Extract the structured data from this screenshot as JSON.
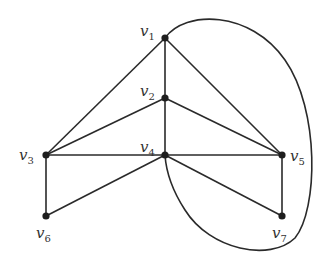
{
  "graph": {
    "nodes": [
      {
        "id": "v1",
        "label": "v",
        "sub": "1",
        "x": 165,
        "y": 38,
        "lx": 140,
        "ly": 36
      },
      {
        "id": "v2",
        "label": "v",
        "sub": "2",
        "x": 165,
        "y": 98,
        "lx": 140,
        "ly": 96
      },
      {
        "id": "v3",
        "label": "v",
        "sub": "3",
        "x": 46,
        "y": 155,
        "lx": 19,
        "ly": 160
      },
      {
        "id": "v4",
        "label": "v",
        "sub": "4",
        "x": 165,
        "y": 155,
        "lx": 140,
        "ly": 152
      },
      {
        "id": "v5",
        "label": "v",
        "sub": "5",
        "x": 282,
        "y": 155,
        "lx": 290,
        "ly": 161
      },
      {
        "id": "v6",
        "label": "v",
        "sub": "6",
        "x": 46,
        "y": 216,
        "lx": 36,
        "ly": 238
      },
      {
        "id": "v7",
        "label": "v",
        "sub": "7",
        "x": 282,
        "y": 216,
        "lx": 272,
        "ly": 238
      }
    ],
    "edges": [
      [
        "v1",
        "v2"
      ],
      [
        "v1",
        "v3"
      ],
      [
        "v1",
        "v5"
      ],
      [
        "v2",
        "v3"
      ],
      [
        "v2",
        "v4"
      ],
      [
        "v2",
        "v5"
      ],
      [
        "v3",
        "v4"
      ],
      [
        "v3",
        "v6"
      ],
      [
        "v4",
        "v5"
      ],
      [
        "v4",
        "v6"
      ],
      [
        "v4",
        "v7"
      ],
      [
        "v5",
        "v7"
      ]
    ],
    "curved_edges": [
      {
        "from": "v1",
        "to": "v4",
        "path": "M165,38 C185,10 250,10 285,60 C320,110 318,210 295,238 C270,262 210,250 185,210 C172,190 166,170 165,155"
      }
    ]
  }
}
